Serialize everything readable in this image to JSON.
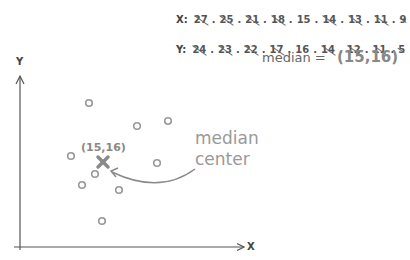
{
  "x_row": {
    "label": "X:",
    "values": [
      {
        "v": "27",
        "struck": true
      },
      {
        "v": "25",
        "struck": true
      },
      {
        "v": "21",
        "struck": true
      },
      {
        "v": "18",
        "struck": true
      },
      {
        "v": "15",
        "struck": false
      },
      {
        "v": "14",
        "struck": true
      },
      {
        "v": "13",
        "struck": true
      },
      {
        "v": "11",
        "struck": true
      },
      {
        "v": "9",
        "struck": true
      }
    ]
  },
  "y_row": {
    "label": "Y:",
    "values": [
      {
        "v": "24",
        "struck": true
      },
      {
        "v": "23",
        "struck": true
      },
      {
        "v": "22",
        "struck": true
      },
      {
        "v": "17",
        "struck": true
      },
      {
        "v": "16",
        "struck": false
      },
      {
        "v": "14",
        "struck": true
      },
      {
        "v": "12",
        "struck": true
      },
      {
        "v": "11",
        "struck": true
      },
      {
        "v": "5",
        "struck": true
      }
    ]
  },
  "median": {
    "equation_label": "median =",
    "value": "(15,16)",
    "point_label": "(15,16)",
    "callout_line1": "median",
    "callout_line2": "center"
  },
  "axes": {
    "x_label": "X",
    "y_label": "Y"
  },
  "colors": {
    "point": "#999999",
    "median_marker": "#8a8a8a",
    "axis": "#555555",
    "callout": "#999999"
  },
  "chart_data": {
    "type": "scatter",
    "title": "",
    "xlabel": "X",
    "ylabel": "Y",
    "points_px": [
      [
        89,
        103
      ],
      [
        137,
        126
      ],
      [
        168,
        121
      ],
      [
        71,
        156
      ],
      [
        157,
        163
      ],
      [
        95,
        174
      ],
      [
        82,
        185
      ],
      [
        119,
        190
      ],
      [
        102,
        221
      ]
    ],
    "median_center": {
      "x": 15,
      "y": 16,
      "px": [
        103,
        162
      ]
    },
    "x_values": [
      27,
      25,
      21,
      18,
      15,
      14,
      13,
      11,
      9
    ],
    "y_values": [
      24,
      23,
      22,
      17,
      16,
      14,
      12,
      11,
      5
    ],
    "annotations": [
      "median = (15,16)",
      "median center"
    ],
    "grid": false
  }
}
